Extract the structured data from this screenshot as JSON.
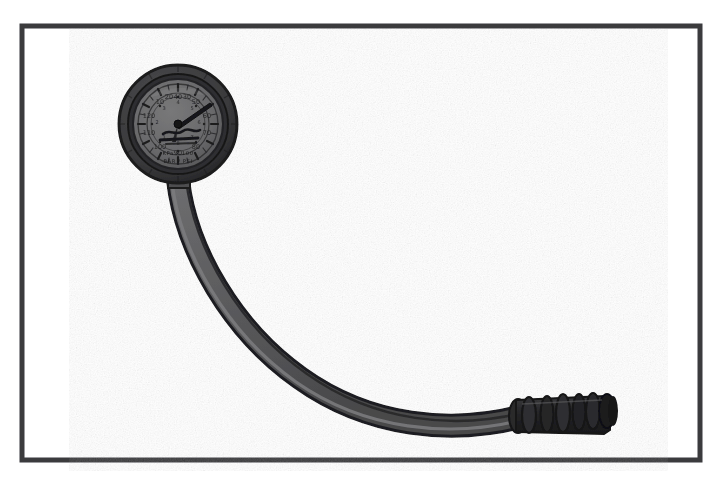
{
  "image": {
    "title": "Pressure gauge with flexible hose",
    "kind": "scanned-line-illustration",
    "width": 717,
    "height": 491,
    "background_color": "#ffffff",
    "partial_cropped_caption": "scanned header text cropped at top edge"
  },
  "frame": {
    "name": "border-frame",
    "x": 22,
    "y": 26,
    "width": 678,
    "height": 434,
    "stroke_color": "#3b3b3d",
    "stroke_width": 5,
    "fill": "#ffffff"
  },
  "colors": {
    "ink": "#2e2e30",
    "outline": "#232325",
    "hose_fill": "#5c5c5e",
    "hose_highlight": "#7a7a7c",
    "bezel": "#3a3a3c",
    "dial_face": "#6a6a6c",
    "dial_inner": "#636365",
    "tip_dark": "#1f1f21",
    "frame": "#3b3b3d",
    "paper": "#ffffff"
  },
  "gauge": {
    "name": "pressure-gauge",
    "center_x": 178,
    "center_y": 124,
    "bezel_outer_radius": 59,
    "bezel_inner_radius": 50,
    "face_radius": 45,
    "inner_ring_radius": 33,
    "hub_radius": 4,
    "needle_angle_deg": -34,
    "needle_length": 30,
    "dial_ticks_major": 12,
    "dial_ticks_minor": 36,
    "outer_scale_labels": [
      "10",
      "20",
      "30",
      "40",
      "50",
      "60",
      "70",
      "80",
      "90",
      "100",
      "110",
      "120"
    ],
    "inner_scale_labels": [
      "1",
      "2",
      "3",
      "4",
      "5",
      "6",
      "7",
      "8"
    ],
    "face_text_line_1": "PSI",
    "face_text_line_2": "KPa x 100",
    "face_text_line_3": "BAR",
    "legibility_note": "dial legends are blurred in the scan and not fully readable"
  },
  "hose": {
    "name": "flexible-hose",
    "path": "M 178 180 C 186 250 232 330 300 378 C 370 428 452 434 520 417",
    "stroke_width": 19,
    "outline_width": 23,
    "highlight_width": 4,
    "start_x": 178,
    "start_y": 180,
    "end_x": 520,
    "end_y": 417
  },
  "fitting": {
    "name": "barbed-hose-fitting",
    "x": 512,
    "y": 392,
    "width": 110,
    "height": 42,
    "rib_count": 6,
    "ribs": [
      {
        "cx": 528,
        "rx": 7
      },
      {
        "cx": 546,
        "rx": 6
      },
      {
        "cx": 562,
        "rx": 7
      },
      {
        "cx": 578,
        "rx": 6
      },
      {
        "cx": 592,
        "rx": 7
      },
      {
        "cx": 606,
        "rx": 8
      }
    ],
    "tip_cx": 612,
    "tip_ry": 16
  }
}
